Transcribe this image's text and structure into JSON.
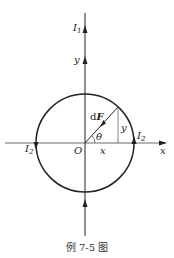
{
  "diagram": {
    "caption": "例 7-5 图",
    "labels": {
      "current_top": "I",
      "current_top_sub": "1",
      "y_axis": "y",
      "x_axis": "x",
      "origin": "O",
      "force": "F",
      "force_prefix": "d",
      "angle": "θ",
      "x_component": "x",
      "y_component": "y",
      "current_left": "I",
      "current_left_sub": "2",
      "current_right": "I",
      "current_right_sub": "2"
    },
    "colors": {
      "stroke": "#222222",
      "thin_stroke": "#555555"
    }
  }
}
